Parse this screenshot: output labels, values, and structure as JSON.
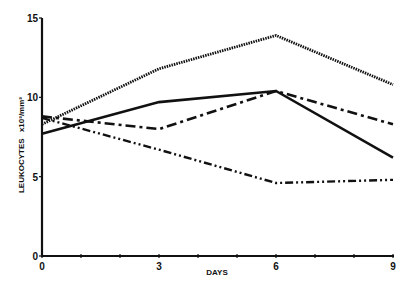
{
  "chart_data": {
    "type": "line",
    "title": "",
    "xlabel": "DAYS",
    "ylabel": "LEUKOCYTES x10³/mm³",
    "x": [
      0,
      3,
      6,
      9
    ],
    "xticks": [
      0,
      3,
      6,
      9
    ],
    "xlim": [
      0,
      9
    ],
    "yticks": [
      0,
      5,
      10,
      15
    ],
    "ylim": [
      0,
      15
    ],
    "grid": false,
    "legend": null,
    "series": [
      {
        "name": "dotted",
        "style": "dotted",
        "values": [
          8.3,
          11.8,
          13.9,
          10.8
        ]
      },
      {
        "name": "solid",
        "style": "solid",
        "values": [
          7.7,
          9.7,
          10.4,
          6.2
        ]
      },
      {
        "name": "dash-dot",
        "style": "dash-dot",
        "values": [
          8.8,
          8.0,
          10.4,
          8.3
        ]
      },
      {
        "name": "dash-dot-dot",
        "style": "dash-dot-dot",
        "values": [
          8.7,
          6.7,
          4.6,
          4.8
        ]
      }
    ]
  },
  "axis": {
    "x_title": "DAYS",
    "y_title_main": "LEUKOCYTES",
    "y_title_unit": "x10³/mm³"
  },
  "colors": {
    "line": "#111111",
    "background": "#ffffff"
  }
}
